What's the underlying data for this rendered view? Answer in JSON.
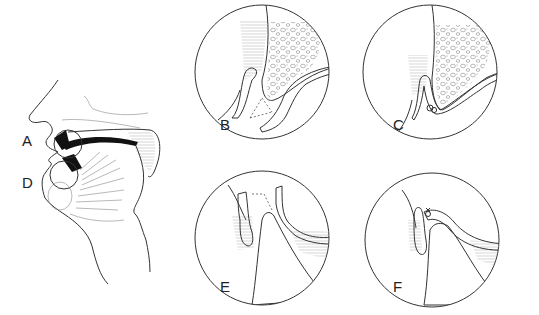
{
  "figure": {
    "type": "anatomical line drawing",
    "panels": [
      {
        "id": "overview",
        "label_markers": [
          "A",
          "D"
        ],
        "description": "sagittal profile of face with two circled regions at lips/teeth"
      },
      {
        "id": "B",
        "label": "B"
      },
      {
        "id": "C",
        "label": "C"
      },
      {
        "id": "E",
        "label": "E"
      },
      {
        "id": "F",
        "label": "F"
      }
    ],
    "labels": {
      "a": "A",
      "d": "D",
      "b": "B",
      "c": "C",
      "e": "E",
      "f": "F"
    },
    "colors": {
      "line": "#333333",
      "background": "#ffffff",
      "fill_dark": "#111111"
    }
  }
}
